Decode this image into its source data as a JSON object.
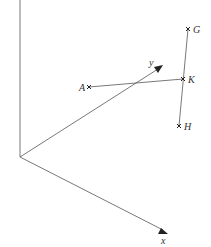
{
  "diagram": {
    "type": "3d-coordinate-axes-with-points",
    "colors": {
      "line": "#555555",
      "marker": "#222222",
      "text": "#333333",
      "background": "#ffffff"
    },
    "axes": {
      "origin": {
        "x": 20,
        "y": 157
      },
      "z_axis": {
        "label": "",
        "end": {
          "x": 20,
          "y": 0
        }
      },
      "y_axis": {
        "label": "y",
        "end": {
          "x": 161,
          "y": 67
        }
      },
      "x_axis": {
        "label": "x",
        "end": {
          "x": 166,
          "y": 232
        }
      }
    },
    "points": [
      {
        "name": "A",
        "x": 89,
        "y": 87,
        "label_side": "left"
      },
      {
        "name": "K",
        "x": 183,
        "y": 79,
        "label_side": "right"
      },
      {
        "name": "G",
        "x": 188,
        "y": 29,
        "label_side": "right"
      },
      {
        "name": "H",
        "x": 179,
        "y": 126,
        "label_side": "right"
      }
    ],
    "segments": [
      {
        "from": "A",
        "to": "K"
      },
      {
        "from": "G",
        "to": "H"
      }
    ],
    "labels": {
      "y": "y",
      "x": "x",
      "A": "A",
      "K": "K",
      "G": "G",
      "H": "H"
    }
  }
}
